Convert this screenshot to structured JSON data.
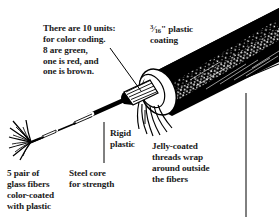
{
  "image": {
    "title": "Fiber optic cable cutaway illustration",
    "width": 279,
    "height": 217,
    "background_color": "#ffffff",
    "ink_color": "#000000"
  },
  "captions": {
    "units": "There are 10 units:\nfor color coding.\n8 are green,\none is red, and\none is brown.",
    "coating_numerator": "3",
    "coating_denominator": "16",
    "coating_rest": "\" plastic\ncoating",
    "coating_full": "3/16\" plastic coating",
    "rigid_plastic": "Rigid\nplastic",
    "jelly_threads": "Jelly-coated\nthreads wrap\naround outside\nthe fibers",
    "glass_fibers": "5 pair of\nglass fibers\ncolor-coated\nwith plastic",
    "steel_core": "Steel core\nfor strength"
  },
  "artwork": {
    "cable_label": "black-plastic-jacketed-cable",
    "cut_end_label": "cut-end-ferrule",
    "bundle_label": "striped-fiber-unit-bundle",
    "threads_label": "jelly-coated-threads",
    "strand_label": "thin-extracted-fiber-strand",
    "brush_label": "frayed-fiber-splay",
    "leader_lines": 4
  }
}
